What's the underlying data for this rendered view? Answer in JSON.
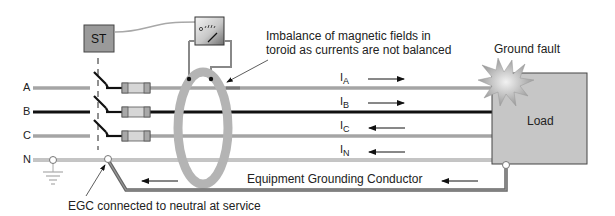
{
  "diagram": {
    "switch_box_label": "ST",
    "lines": [
      {
        "label": "A",
        "style": "gray"
      },
      {
        "label": "B",
        "style": "black"
      },
      {
        "label": "C",
        "style": "gray"
      },
      {
        "label": "N",
        "style": "white"
      }
    ],
    "currents": [
      {
        "symbol": "I",
        "sub": "A",
        "direction": "right"
      },
      {
        "symbol": "I",
        "sub": "B",
        "direction": "right"
      },
      {
        "symbol": "I",
        "sub": "C",
        "direction": "left"
      },
      {
        "symbol": "I",
        "sub": "N",
        "direction": "left"
      }
    ],
    "annotations": {
      "toroid_note_line1": "Imbalance of magnetic fields in",
      "toroid_note_line2": "toroid as currents are not balanced",
      "ground_fault": "Ground fault",
      "load": "Load",
      "egc": "Equipment Grounding Conductor",
      "egc_neutral": "EGC connected to neutral at service"
    },
    "colors": {
      "gray_conductor": "#8a8a8a",
      "black_conductor": "#111111",
      "toroid": "#b4b4b4",
      "load_box": "#c6c6c6",
      "st_box": "#9a9a9a"
    }
  }
}
